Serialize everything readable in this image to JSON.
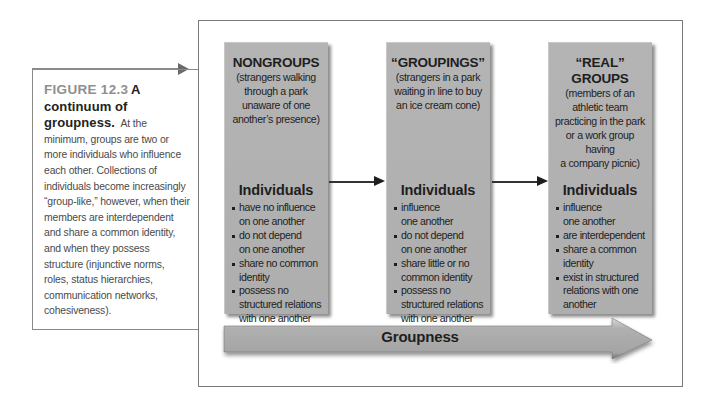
{
  "caption": {
    "figure_number": "FIGURE 12.3",
    "title": "A continuum of groupness.",
    "title_lead": "A",
    "title_rest": "continuum of groupness.",
    "body": "At the minimum, groups are two or more individuals who influence each other. Collections of individuals become increasingly “group-like,” however, when their members are interdependent and share a common identity, and when they possess structure (injunctive norms, roles, status hierarchies, communication networks, cohesiveness)."
  },
  "panels": [
    {
      "title": "NONGROUPS",
      "description": "(strangers walking\nthrough a park\nunaware of one\nanother’s presence)",
      "heading": "Individuals",
      "items": [
        "have no influence\non one another",
        "do not depend\non one another",
        "share no common\nidentity",
        "possess no\nstructured relations\nwith one another"
      ]
    },
    {
      "title": "“GROUPINGS”",
      "description": "(strangers in a park\nwaiting in line to buy\nan ice cream cone)",
      "heading": "Individuals",
      "items": [
        "influence\none another",
        "do not depend\non one another",
        "share little or no\ncommon identity",
        "possess no\nstructured relations\nwith one another"
      ]
    },
    {
      "title": "“REAL” GROUPS",
      "description": "(members of an\nathletic team\npracticing in the park\nor a work group having\na company picnic)",
      "heading": "Individuals",
      "items": [
        "influence\none another",
        "are interdependent",
        "share a common\nidentity",
        "exist in structured\nrelations with one\nanother"
      ]
    }
  ],
  "axis": {
    "label": "Groupness"
  },
  "colors": {
    "panel_fill": "#b1b1b1",
    "arrow_fill": "#a9a9a9",
    "border": "#7a7a7a",
    "caption_figure_number": "#8f8f8f",
    "text": "#1e1e1e"
  }
}
